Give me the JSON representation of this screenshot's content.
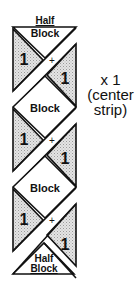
{
  "diagram": {
    "top_half_block": {
      "line1": "Half",
      "line2": "Block"
    },
    "bottom_half_block": {
      "line1": "Half",
      "line2": "Block"
    },
    "triangle_label": "1",
    "plus_sign": "+",
    "block_labels": [
      "Block",
      "Block"
    ],
    "units": [
      {
        "left_label": "1",
        "right_label": "1",
        "plus": "+"
      },
      {
        "left_label": "1",
        "right_label": "1",
        "plus": "+"
      },
      {
        "left_label": "1",
        "right_label": "1",
        "plus": "+"
      }
    ],
    "quantity": {
      "line1": "x 1",
      "line2": "(center",
      "line3": "strip)"
    },
    "colors": {
      "shade": "#d6d6d6",
      "line": "#111111",
      "background": "#ffffff"
    }
  }
}
